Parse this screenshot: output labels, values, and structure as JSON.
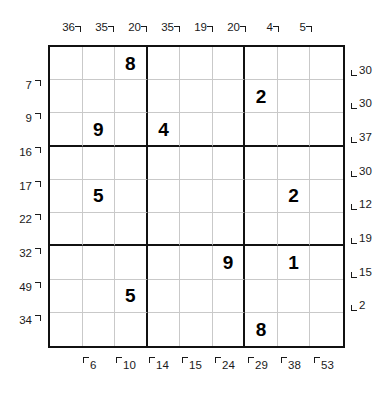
{
  "puzzle": {
    "type": "little-killer-sudoku",
    "grid_size": 9,
    "box_size": 3
  },
  "givens": [
    {
      "row": 1,
      "col": 3,
      "value": "8"
    },
    {
      "row": 2,
      "col": 7,
      "value": "2"
    },
    {
      "row": 3,
      "col": 2,
      "value": "9"
    },
    {
      "row": 3,
      "col": 4,
      "value": "4"
    },
    {
      "row": 5,
      "col": 2,
      "value": "5"
    },
    {
      "row": 5,
      "col": 8,
      "value": "2"
    },
    {
      "row": 7,
      "col": 6,
      "value": "9"
    },
    {
      "row": 7,
      "col": 8,
      "value": "1"
    },
    {
      "row": 8,
      "col": 3,
      "value": "5"
    },
    {
      "row": 9,
      "col": 7,
      "value": "8"
    }
  ],
  "clues": {
    "top": [
      {
        "label": "36",
        "col": 1,
        "arrow": "down-right"
      },
      {
        "label": "35",
        "col": 2,
        "arrow": "down-right"
      },
      {
        "label": "20",
        "col": 3,
        "arrow": "down-right"
      },
      {
        "label": "35",
        "col": 4,
        "arrow": "down-right"
      },
      {
        "label": "19",
        "col": 5,
        "arrow": "down-right"
      },
      {
        "label": "20",
        "col": 6,
        "arrow": "down-right"
      },
      {
        "label": "4",
        "col": 7,
        "arrow": "down-right"
      },
      {
        "label": "5",
        "col": 8,
        "arrow": "down-right"
      }
    ],
    "left": [
      {
        "label": "7",
        "row": 2,
        "arrow": "up-right"
      },
      {
        "label": "9",
        "row": 3,
        "arrow": "up-right"
      },
      {
        "label": "16",
        "row": 4,
        "arrow": "up-right"
      },
      {
        "label": "17",
        "row": 5,
        "arrow": "up-right"
      },
      {
        "label": "22",
        "row": 6,
        "arrow": "up-right"
      },
      {
        "label": "32",
        "row": 7,
        "arrow": "up-right"
      },
      {
        "label": "49",
        "row": 8,
        "arrow": "up-right"
      },
      {
        "label": "34",
        "row": 9,
        "arrow": "up-right"
      }
    ],
    "right": [
      {
        "label": "30",
        "row": 1,
        "arrow": "down-left"
      },
      {
        "label": "30",
        "row": 2,
        "arrow": "down-left"
      },
      {
        "label": "37",
        "row": 3,
        "arrow": "down-left"
      },
      {
        "label": "30",
        "row": 4,
        "arrow": "down-left"
      },
      {
        "label": "12",
        "row": 5,
        "arrow": "down-left"
      },
      {
        "label": "19",
        "row": 6,
        "arrow": "down-left"
      },
      {
        "label": "15",
        "row": 7,
        "arrow": "down-left"
      },
      {
        "label": "2",
        "row": 8,
        "arrow": "down-left"
      }
    ],
    "bottom": [
      {
        "label": "6",
        "col": 2,
        "arrow": "up-left"
      },
      {
        "label": "10",
        "col": 3,
        "arrow": "up-left"
      },
      {
        "label": "14",
        "col": 4,
        "arrow": "up-left"
      },
      {
        "label": "15",
        "col": 5,
        "arrow": "up-left"
      },
      {
        "label": "24",
        "col": 6,
        "arrow": "up-left"
      },
      {
        "label": "29",
        "col": 7,
        "arrow": "up-left"
      },
      {
        "label": "38",
        "col": 8,
        "arrow": "up-left"
      },
      {
        "label": "53",
        "col": 9,
        "arrow": "up-left"
      }
    ]
  },
  "colors": {
    "grid_line_thin": "#c9c9c9",
    "grid_line_thick": "#111111",
    "digit": "#000000",
    "clue_text": "#1a1a1a",
    "background": "#ffffff"
  }
}
